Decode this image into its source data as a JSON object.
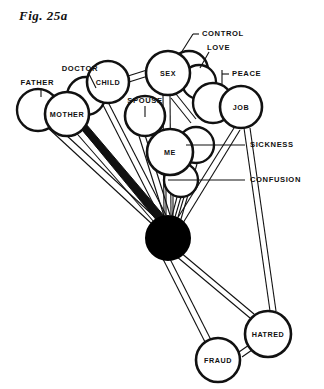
{
  "figure": {
    "number": "Fig. 25a",
    "caption_partial": "The text below is cut off at the image edge"
  },
  "diagram": {
    "type": "node-link-balloon-diagram",
    "colors": {
      "ink": "#111111",
      "paper": "#ffffff",
      "hub_fill": "#000000"
    },
    "hub": {
      "name": "hub",
      "cx": 168,
      "cy": 238,
      "r": 22,
      "filled": true,
      "label": ""
    },
    "nodes": [
      {
        "id": "father",
        "label": "FATHER",
        "cx": 38,
        "cy": 110,
        "r": 21,
        "labelled_inline": false
      },
      {
        "id": "mother",
        "label": "MOTHER",
        "cx": 67,
        "cy": 114,
        "r": 22,
        "labelled_inline": true
      },
      {
        "id": "doctor",
        "label": "DOCTOR",
        "cx": 86,
        "cy": 96,
        "r": 19,
        "labelled_inline": false
      },
      {
        "id": "child",
        "label": "CHILD",
        "cx": 108,
        "cy": 82,
        "r": 21,
        "labelled_inline": true
      },
      {
        "id": "spouse",
        "label": "SPOUSE",
        "cx": 145,
        "cy": 116,
        "r": 20,
        "labelled_inline": true
      },
      {
        "id": "sex",
        "label": "SEX",
        "cx": 168,
        "cy": 73,
        "r": 22,
        "labelled_inline": true
      },
      {
        "id": "control",
        "label": "CONTROL",
        "cx": 189,
        "cy": 70,
        "r": 19,
        "labelled_inline": false
      },
      {
        "id": "love",
        "label": "LOVE",
        "cx": 199,
        "cy": 82,
        "r": 17,
        "labelled_inline": false
      },
      {
        "id": "peace",
        "label": "PEACE",
        "cx": 213,
        "cy": 103,
        "r": 20,
        "labelled_inline": false
      },
      {
        "id": "job",
        "label": "JOB",
        "cx": 241,
        "cy": 107,
        "r": 21,
        "labelled_inline": true
      },
      {
        "id": "me",
        "label": "ME",
        "cx": 170,
        "cy": 152,
        "r": 23,
        "labelled_inline": true
      },
      {
        "id": "sickness",
        "label": "SICKNESS",
        "cx": 196,
        "cy": 145,
        "r": 18,
        "labelled_inline": false
      },
      {
        "id": "confusion",
        "label": "CONFUSION",
        "cx": 181,
        "cy": 180,
        "r": 17,
        "labelled_inline": false
      },
      {
        "id": "hatred",
        "label": "HATRED",
        "cx": 268,
        "cy": 334,
        "r": 23,
        "labelled_inline": true
      },
      {
        "id": "fraud",
        "label": "FRAUD",
        "cx": 218,
        "cy": 360,
        "r": 22,
        "labelled_inline": true
      }
    ],
    "callouts": [
      {
        "id": "callout-father",
        "label": "FATHER",
        "tx": 54,
        "ty": 84,
        "side": "l",
        "lx1": 41,
        "ly1": 88,
        "lx2": 41,
        "ly2": 96
      },
      {
        "id": "callout-doctor",
        "label": "DOCTOR",
        "tx": 97,
        "ty": 70,
        "side": "l",
        "lx1": 89,
        "ly1": 74,
        "lx2": 96,
        "ly2": 87
      },
      {
        "id": "callout-control",
        "label": "CONTROL",
        "tx": 196,
        "ty": 34,
        "side": "r",
        "lx1": 193,
        "ly1": 34,
        "lx2": 181,
        "ly2": 53
      },
      {
        "id": "callout-love",
        "label": "LOVE",
        "tx": 206,
        "ty": 49,
        "side": "r",
        "lx1": 209,
        "ly1": 53,
        "lx2": 200,
        "ly2": 68
      },
      {
        "id": "callout-peace",
        "label": "PEACE",
        "tx": 231,
        "ty": 74,
        "side": "r",
        "lx1": 222,
        "ly1": 74,
        "lx2": 222,
        "ly2": 85
      },
      {
        "id": "callout-spouse",
        "label": "SPOUSE",
        "tx": 145,
        "ty": 104,
        "side": "c",
        "lx1": 145,
        "ly1": 107,
        "lx2": 145,
        "ly2": 116
      },
      {
        "id": "callout-sickness",
        "label": "SICKNESS",
        "tx": 249,
        "ty": 145,
        "side": "r",
        "lx1": 244,
        "ly1": 145,
        "lx2": 186,
        "ly2": 145
      },
      {
        "id": "callout-confusion",
        "label": "CONFUSION",
        "tx": 249,
        "ty": 180,
        "side": "r",
        "lx1": 244,
        "ly1": 180,
        "lx2": 168,
        "ly2": 180
      }
    ],
    "edges": [
      {
        "from": "hub",
        "to": "mother",
        "style": "heavy-solid"
      },
      {
        "from": "hub",
        "to": "father",
        "style": "double-line"
      },
      {
        "from": "hub",
        "to": "doctor",
        "style": "double-line"
      },
      {
        "from": "hub",
        "to": "child",
        "style": "double-line"
      },
      {
        "from": "hub",
        "to": "spouse",
        "style": "double-line"
      },
      {
        "from": "hub",
        "to": "sex",
        "style": "double-line"
      },
      {
        "from": "hub",
        "to": "me",
        "style": "double-line"
      },
      {
        "from": "hub",
        "to": "job",
        "style": "double-line"
      },
      {
        "from": "hub",
        "to": "sickness",
        "style": "double-line"
      },
      {
        "from": "hub",
        "to": "confusion",
        "style": "double-line"
      },
      {
        "from": "hub",
        "to": "hatred",
        "style": "double-line"
      },
      {
        "from": "hub",
        "to": "fraud",
        "style": "double-line"
      },
      {
        "from": "child",
        "to": "sex",
        "style": "double-line"
      },
      {
        "from": "sex",
        "to": "job",
        "style": "double-line"
      },
      {
        "from": "job",
        "to": "hatred",
        "style": "double-line"
      },
      {
        "from": "fraud",
        "to": "hatred",
        "style": "double-line"
      }
    ]
  }
}
